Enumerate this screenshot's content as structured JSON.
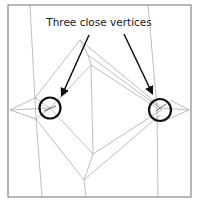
{
  "annotation": {
    "label": "Three close vertices"
  },
  "colors": {
    "edge": "#9a9a9a",
    "frame": "#707070",
    "arrow": "#111111",
    "circle": "#111111"
  },
  "markers": [
    {
      "name": "left-vertex-cluster"
    },
    {
      "name": "right-vertex-cluster"
    }
  ]
}
